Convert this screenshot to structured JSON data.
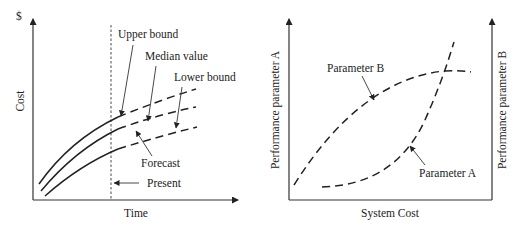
{
  "left_diagram": {
    "y_axis_unit": "$",
    "y_axis_label": "Cost",
    "x_axis_label": "Time",
    "present_label": "Present",
    "forecast_label": "Forecast",
    "curves": [
      {
        "name": "upper",
        "label": "Upper bound"
      },
      {
        "name": "median",
        "label": "Median value"
      },
      {
        "name": "lower",
        "label": "Lower bound"
      }
    ]
  },
  "right_diagram": {
    "x_axis_label": "System Cost",
    "left_axis_label": "Performance parameter A",
    "right_axis_label": "Performance parameter B",
    "curves": [
      {
        "name": "parameter-b",
        "label": "Parameter B"
      },
      {
        "name": "parameter-a",
        "label": "Parameter A"
      }
    ]
  },
  "colors": {
    "ink": "#222222",
    "background": "#ffffff"
  }
}
